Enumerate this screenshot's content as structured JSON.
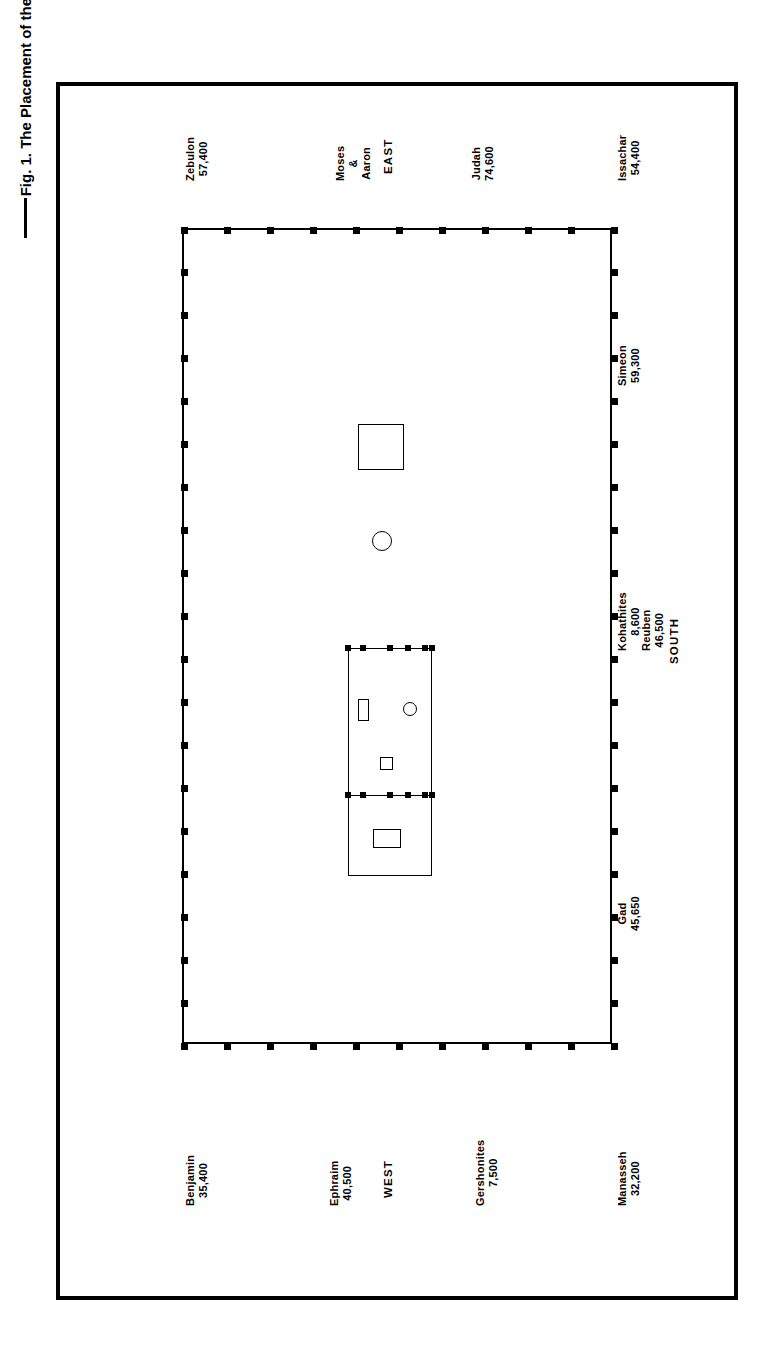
{
  "figure": {
    "caption": "Fig. 1.  The Placement of the Tribes",
    "rule_left": "",
    "rule_right": ""
  },
  "directions": {
    "east": "EAST",
    "west": "WEST",
    "north": "NORTH",
    "south": "SOUTH"
  },
  "center": {
    "leaders_line1": "Moses",
    "leaders_line2": "&",
    "leaders_line3": "Aaron"
  },
  "tribes": [
    {
      "id": "zebulon",
      "name": "Zebulon",
      "count": "57,400"
    },
    {
      "id": "judah",
      "name": "Judah",
      "count": "74,600"
    },
    {
      "id": "issachar",
      "name": "Issachar",
      "count": "54,400"
    },
    {
      "id": "asher",
      "name": "Asher",
      "count": "41,500"
    },
    {
      "id": "dan",
      "name": "Dan",
      "count": "62,700"
    },
    {
      "id": "naphtalim",
      "name": "Naphtalim",
      "count": "53,400"
    },
    {
      "id": "simeon",
      "name": "Simeon",
      "count": "59,300"
    },
    {
      "id": "reuben",
      "name": "Reuben",
      "count": "46,500"
    },
    {
      "id": "gad",
      "name": "Gad",
      "count": "45,650"
    },
    {
      "id": "benjamin",
      "name": "Benjamin",
      "count": "35,400"
    },
    {
      "id": "ephraim",
      "name": "Ephraim",
      "count": "40,500"
    },
    {
      "id": "manasseh",
      "name": "Manasseh",
      "count": "32,200"
    }
  ],
  "levites": [
    {
      "id": "merarites",
      "name": "Merarites",
      "count": "6,200"
    },
    {
      "id": "kohathites",
      "name": "Kohathites",
      "count": "8,600"
    },
    {
      "id": "gershonites",
      "name": "Gershonites",
      "count": "7,500"
    }
  ],
  "symbols": {
    "outer_altar": "square-symbol",
    "laver": "circle-symbol",
    "tabernacle_court": "court-rectangle",
    "table_of_showbread": "small-rectangle-symbol",
    "lampstand": "small-circle-symbol",
    "altar_of_incense": "small-square-symbol",
    "bronze_altar": "rectangle-symbol"
  },
  "colors": {
    "ink": "#000000",
    "paper": "#ffffff"
  }
}
